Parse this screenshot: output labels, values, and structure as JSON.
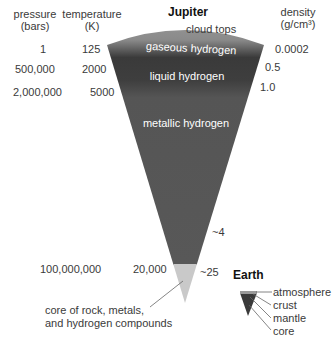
{
  "title": "Jupiter",
  "headers": {
    "pressure": "pressure",
    "pressure_unit": "(bars)",
    "temperature": "temperature",
    "temperature_unit": "(K)",
    "density": "density",
    "density_unit": "(g/cm³)"
  },
  "layers": [
    {
      "name": "cloud tops"
    },
    {
      "name": "gaseous hydrogen",
      "color": "#8f8f8f"
    },
    {
      "name": "liquid hydrogen",
      "color": "#3c3c3c"
    },
    {
      "name": "metallic hydrogen",
      "color": "#555555"
    },
    {
      "name": "core",
      "color": "#c8c8c8"
    }
  ],
  "rows": [
    {
      "pressure": "1",
      "temperature": "125",
      "density": "0.0002"
    },
    {
      "pressure": "500,000",
      "temperature": "2000",
      "density": "0.5"
    },
    {
      "pressure": "2,000,000",
      "temperature": "5000",
      "density": "1.0"
    },
    {
      "density": "~4"
    },
    {
      "pressure": "100,000,000",
      "temperature": "20,000",
      "density": "~25"
    }
  ],
  "core_label_line1": "core of rock, metals,",
  "core_label_line2": "and hydrogen compounds",
  "earth": {
    "title": "Earth",
    "layers": [
      "atmosphere",
      "crust",
      "mantle",
      "core"
    ]
  }
}
